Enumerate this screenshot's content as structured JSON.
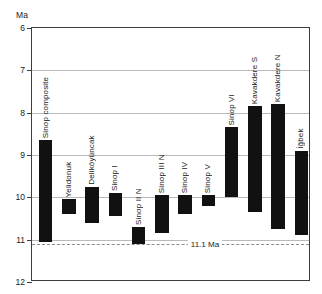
{
  "chart_data": {
    "type": "bar",
    "title": "",
    "subtitle": "",
    "xlabel": "",
    "ylabel": "Ma",
    "ylim": [
      6,
      12
    ],
    "y_inverted": true,
    "grid": "horizontal",
    "legend": "none",
    "yticks": [
      6,
      7,
      8,
      9,
      10,
      11,
      12
    ],
    "ytick_labels": [
      "6",
      "7",
      "8",
      "9",
      "10",
      "11",
      "12"
    ],
    "orientation": "vertical-range-bars",
    "bar_value_units": "Ma",
    "categories": [
      "Sinop composite",
      "Yelidonuk",
      "Deliköyüncak",
      "Sinop I",
      "Sinop II N",
      "Sinop III N",
      "Sinop IV",
      "Sinop V",
      "Sinop VI",
      "Kavakdere S",
      "Kavakdere N",
      "İğbek"
    ],
    "ranges": [
      {
        "label": "Sinop composite",
        "top": 8.65,
        "bottom": 11.05
      },
      {
        "label": "Yelidonuk",
        "top": 10.05,
        "bottom": 10.4
      },
      {
        "label": "Deliköyüncak",
        "top": 9.75,
        "bottom": 10.6
      },
      {
        "label": "Sinop I",
        "top": 9.9,
        "bottom": 10.45
      },
      {
        "label": "Sinop II N",
        "top": 10.7,
        "bottom": 11.1
      },
      {
        "label": "Sinop III N",
        "top": 9.95,
        "bottom": 10.85
      },
      {
        "label": "Sinop IV",
        "top": 9.95,
        "bottom": 10.4
      },
      {
        "label": "Sinop V",
        "top": 9.95,
        "bottom": 10.2
      },
      {
        "label": "Sinop VI",
        "top": 8.35,
        "bottom": 10.0
      },
      {
        "label": "Kavakdere S",
        "top": 7.85,
        "bottom": 10.35
      },
      {
        "label": "Kavakdere N",
        "top": 7.8,
        "bottom": 10.75
      },
      {
        "label": "İğbek",
        "top": 8.9,
        "bottom": 10.9
      }
    ],
    "annotations": [
      {
        "type": "reference-line",
        "value": 11.1,
        "label": "11.1 Ma",
        "style": "dashed"
      }
    ],
    "bar_color": "#111111",
    "grid_color": "#b9b9b9",
    "frame_color": "#3d3d3d"
  }
}
